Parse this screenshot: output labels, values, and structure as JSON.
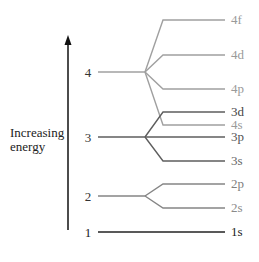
{
  "axis": {
    "label_line1": "Increasing",
    "label_line2": "energy"
  },
  "shells": [
    {
      "n": "4",
      "y": 72,
      "color": "#9a9a9a"
    },
    {
      "n": "3",
      "y": 137,
      "color": "#5e5e5e"
    },
    {
      "n": "2",
      "y": 196,
      "color": "#7e7e7e"
    },
    {
      "n": "1",
      "y": 232,
      "color": "#222222"
    }
  ],
  "subshells": [
    {
      "label": "4f",
      "y": 20,
      "shell": "4",
      "color": "#9a9a9a"
    },
    {
      "label": "4d",
      "y": 55,
      "shell": "4",
      "color": "#9a9a9a"
    },
    {
      "label": "4p",
      "y": 89,
      "shell": "4",
      "color": "#9a9a9a"
    },
    {
      "label": "3d",
      "y": 112,
      "shell": "3",
      "color": "#5e5e5e"
    },
    {
      "label": "4s",
      "y": 125,
      "shell": "4",
      "color": "#9a9a9a"
    },
    {
      "label": "3p",
      "y": 137,
      "shell": "3",
      "color": "#5e5e5e"
    },
    {
      "label": "3s",
      "y": 161,
      "shell": "3",
      "color": "#5e5e5e"
    },
    {
      "label": "2p",
      "y": 184,
      "shell": "2",
      "color": "#7e7e7e"
    },
    {
      "label": "2s",
      "y": 208,
      "shell": "2",
      "color": "#8a8a8a"
    },
    {
      "label": "1s",
      "y": 232,
      "shell": "1",
      "color": "#222222"
    }
  ]
}
